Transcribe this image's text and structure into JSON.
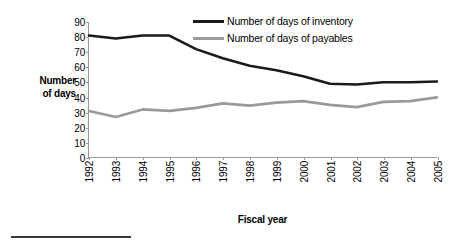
{
  "axes": {
    "y_title_line1": "Number",
    "y_title_line2": "of days",
    "x_title": "Fiscal year"
  },
  "legend": {
    "items": [
      {
        "label": "Number of days of inventory",
        "color": "#1a1a1a",
        "key": "inventory"
      },
      {
        "label": "Number of days of payables",
        "color": "#9a9a9a",
        "key": "payables"
      }
    ]
  },
  "chart_data": {
    "type": "line",
    "title": "",
    "xlabel": "Fiscal year",
    "ylabel": "Number of days",
    "categories": [
      "1992",
      "1993",
      "1994",
      "1995",
      "1996",
      "1997",
      "1998",
      "1999",
      "2000",
      "2001",
      "2002",
      "2003",
      "2004",
      "2005"
    ],
    "ylim": [
      0,
      90
    ],
    "yticks": [
      0,
      10,
      20,
      30,
      40,
      50,
      60,
      70,
      80,
      90
    ],
    "grid": false,
    "legend_position": "top-center",
    "series": [
      {
        "name": "Number of days of inventory",
        "color": "#1a1a1a",
        "values": [
          81,
          79,
          81,
          81,
          72,
          66,
          61,
          58,
          54,
          49,
          48.5,
          50,
          50,
          50.5
        ]
      },
      {
        "name": "Number of days of payables",
        "color": "#9a9a9a",
        "values": [
          31,
          27,
          32,
          31,
          33,
          36,
          34.5,
          36.5,
          37.5,
          35,
          33.5,
          37,
          37.5,
          40
        ]
      }
    ]
  }
}
